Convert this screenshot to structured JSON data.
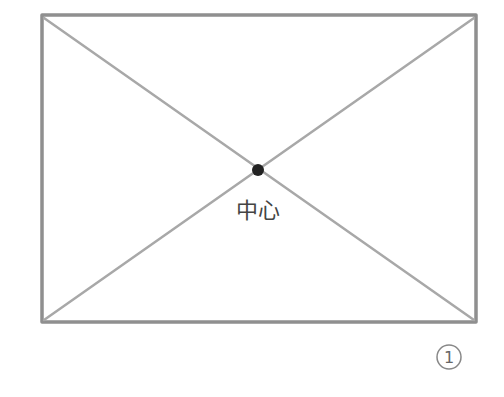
{
  "diagram": {
    "shape": "rectangle-with-diagonals",
    "rectangle": {
      "x1": 42,
      "y1": 15,
      "x2": 476,
      "y2": 322
    },
    "center_point": {
      "x": 258,
      "y": 170
    },
    "center_label": "中心",
    "figure_number": "1",
    "colors": {
      "stroke": "#8f8f8f",
      "diagonal": "#a8a8a8",
      "center_dot": "#222222",
      "label": "#444444",
      "number": "#666666"
    }
  }
}
